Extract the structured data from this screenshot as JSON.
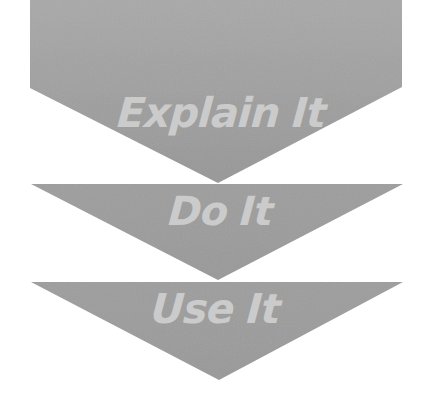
{
  "diagram": {
    "type": "stacked-chevron-flow",
    "steps": [
      {
        "label": "Explain It",
        "shape": "pentagon-arrow-down"
      },
      {
        "label": "Do It",
        "shape": "triangle-down"
      },
      {
        "label": "Use It",
        "shape": "triangle-down"
      }
    ],
    "colors": {
      "shape_fill": "#9c9c9c",
      "shape_fill_light": "#a8a8a8",
      "label_text": "#cbcbcb",
      "background": "#ffffff"
    }
  }
}
